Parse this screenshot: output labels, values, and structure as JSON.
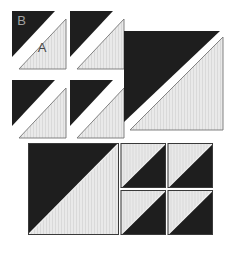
{
  "figure": {
    "type": "quilt-block-assembly-diagram",
    "labels": {
      "light_fabric": "A",
      "dark_fabric": "B"
    },
    "colors": {
      "background": "#ffffff",
      "dark_fabric": "#1e1e1e",
      "light_fabric": "#e9e9e9",
      "light_fabric_stripe": "#d9d9d9",
      "light_outline": "#757575",
      "block_outline": "#3a3a3a",
      "seam_line": "#f0f0f0",
      "label_on_dark": "#a2a2a2",
      "label_on_light": "#474747"
    },
    "exploded_units": [
      {
        "id": "small-1",
        "x": 12,
        "y": 11,
        "scale": "small",
        "show_labels": true
      },
      {
        "id": "small-2",
        "x": 70,
        "y": 11,
        "scale": "small",
        "show_labels": false
      },
      {
        "id": "small-3",
        "x": 12,
        "y": 80,
        "scale": "small",
        "show_labels": false
      },
      {
        "id": "small-4",
        "x": 70,
        "y": 80,
        "scale": "small",
        "show_labels": false
      },
      {
        "id": "large-1",
        "x": 124,
        "y": 31,
        "scale": "large",
        "show_labels": false
      }
    ],
    "assembled_block": {
      "x": 28,
      "y": 143,
      "width": 185,
      "height": 92,
      "large_square": {
        "w": 91,
        "h": 92,
        "dark_corner": "top-left"
      },
      "small_grid": {
        "rows": 2,
        "cols": 2,
        "dark_corner": "bottom-right",
        "cell_xs": [
          92.5,
          139.5
        ],
        "cell_ys": [
          0,
          47
        ],
        "cell_w": 45.5,
        "cell_h": 45
      }
    }
  }
}
